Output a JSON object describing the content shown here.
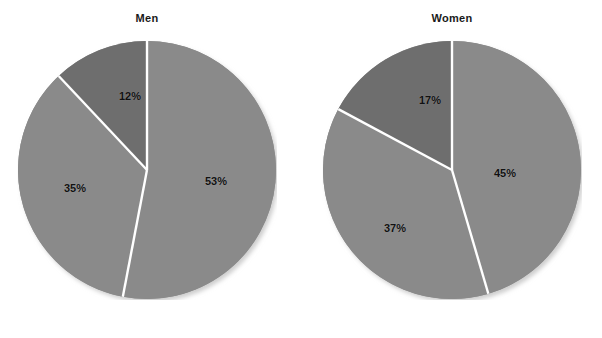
{
  "chart_data": [
    {
      "type": "pie",
      "title": "Men",
      "categories": [
        "53%",
        "35%",
        "12%"
      ],
      "values": [
        53,
        35,
        12
      ],
      "labels": [
        "53%",
        "35%",
        "12%"
      ],
      "colors": [
        "#8a8a8a",
        "#8a8a8a",
        "#6e6e6e"
      ],
      "start_angle_deg": 0,
      "direction": "clockwise",
      "legend": "none",
      "grid": false,
      "xlabel": "",
      "ylabel": ""
    },
    {
      "type": "pie",
      "title": "Women",
      "categories": [
        "45%",
        "37%",
        "17%"
      ],
      "values": [
        45,
        37,
        17
      ],
      "labels": [
        "45%",
        "37%",
        "17%"
      ],
      "colors": [
        "#8a8a8a",
        "#8a8a8a",
        "#6e6e6e"
      ],
      "start_angle_deg": 0,
      "direction": "clockwise",
      "legend": "none",
      "grid": false,
      "xlabel": "",
      "ylabel": ""
    }
  ],
  "figure": {
    "background": "#ffffff",
    "separator_color": "#ffffff",
    "label_color": "#111111",
    "title_color": "#1a1a1a"
  },
  "charts": {
    "men": {
      "title": "Men",
      "slices": [
        {
          "label": "53%",
          "value": 53
        },
        {
          "label": "35%",
          "value": 35
        },
        {
          "label": "12%",
          "value": 12
        }
      ]
    },
    "women": {
      "title": "Women",
      "slices": [
        {
          "label": "45%",
          "value": 45
        },
        {
          "label": "37%",
          "value": 37
        },
        {
          "label": "17%",
          "value": 17
        }
      ]
    }
  },
  "caption": {
    "text": ""
  }
}
